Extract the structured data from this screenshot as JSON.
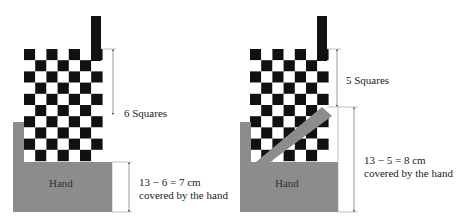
{
  "colors": {
    "dark": "#111111",
    "light": "#ffffff",
    "hand": "#8c8c8c",
    "line": "#999999"
  },
  "board": {
    "cols": 7,
    "rows": 10,
    "square": 11.2
  },
  "left": {
    "origin_x": 24,
    "origin_y": 49,
    "hand_label": "Hand",
    "upper_label": "6 Squares",
    "lower_label_line1": "13 − 6 = 7 cm",
    "lower_label_line2": "covered by the hand"
  },
  "right": {
    "origin_x": 250,
    "origin_y": 49,
    "hand_label": "Hand",
    "upper_label": "5 Squares",
    "lower_label_line1": "13 − 5 = 8 cm",
    "lower_label_line2": "covered by the hand"
  }
}
